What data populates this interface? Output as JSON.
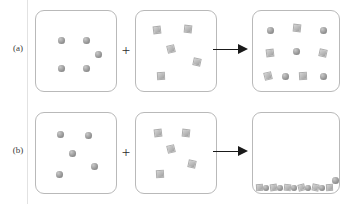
{
  "figure": {
    "operator_symbol": "+",
    "arrow_symbol": "→",
    "colors": {
      "sphere": "#9a9a9a",
      "cube": "#bdbdbd",
      "panel_border": "#b9b9b9",
      "arrow": "#1a1a1a",
      "label_text": "#3a3a3a"
    },
    "rows": [
      {
        "label": "(a)",
        "panels": [
          {
            "name": "spheres-input",
            "contents": "5 spheres",
            "objects": [
              {
                "shape": "sphere",
                "x": 22,
                "y": 26,
                "size": 7
              },
              {
                "shape": "sphere",
                "x": 47,
                "y": 26,
                "size": 7
              },
              {
                "shape": "sphere",
                "x": 59,
                "y": 40,
                "size": 7
              },
              {
                "shape": "sphere",
                "x": 22,
                "y": 54,
                "size": 7
              },
              {
                "shape": "sphere",
                "x": 47,
                "y": 54,
                "size": 7
              }
            ]
          },
          {
            "name": "cubes-input",
            "contents": "5 cubes",
            "objects": [
              {
                "shape": "cube",
                "x": 17,
                "y": 15,
                "size": 8,
                "rot": "r1"
              },
              {
                "shape": "cube",
                "x": 48,
                "y": 14,
                "size": 8,
                "rot": "r2"
              },
              {
                "shape": "cube",
                "x": 31,
                "y": 34,
                "size": 8,
                "rot": "r3"
              },
              {
                "shape": "cube",
                "x": 57,
                "y": 47,
                "size": 8,
                "rot": "r4"
              },
              {
                "shape": "cube",
                "x": 21,
                "y": 61,
                "size": 8,
                "rot": "r5"
              }
            ]
          },
          {
            "name": "mixed-output",
            "contents": "spheres and cubes mixed uniformly",
            "objects": [
              {
                "shape": "sphere",
                "x": 14,
                "y": 16,
                "size": 7
              },
              {
                "shape": "cube",
                "x": 40,
                "y": 13,
                "size": 8,
                "rot": "r2"
              },
              {
                "shape": "sphere",
                "x": 67,
                "y": 16,
                "size": 7
              },
              {
                "shape": "cube",
                "x": 13,
                "y": 38,
                "size": 8,
                "rot": "r1"
              },
              {
                "shape": "sphere",
                "x": 40,
                "y": 37,
                "size": 7
              },
              {
                "shape": "cube",
                "x": 66,
                "y": 38,
                "size": 8,
                "rot": "r4"
              },
              {
                "shape": "cube",
                "x": 11,
                "y": 61,
                "size": 8,
                "rot": "r3"
              },
              {
                "shape": "sphere",
                "x": 29,
                "y": 62,
                "size": 7
              },
              {
                "shape": "cube",
                "x": 46,
                "y": 61,
                "size": 8,
                "rot": "r5"
              },
              {
                "shape": "sphere",
                "x": 67,
                "y": 62,
                "size": 7
              }
            ]
          }
        ]
      },
      {
        "label": "(b)",
        "panels": [
          {
            "name": "spheres-input",
            "contents": "5 spheres",
            "objects": [
              {
                "shape": "sphere",
                "x": 21,
                "y": 18,
                "size": 7
              },
              {
                "shape": "sphere",
                "x": 49,
                "y": 19,
                "size": 7
              },
              {
                "shape": "sphere",
                "x": 33,
                "y": 37,
                "size": 7
              },
              {
                "shape": "sphere",
                "x": 55,
                "y": 50,
                "size": 7
              },
              {
                "shape": "sphere",
                "x": 20,
                "y": 58,
                "size": 7
              }
            ]
          },
          {
            "name": "cubes-input",
            "contents": "5 cubes",
            "objects": [
              {
                "shape": "cube",
                "x": 18,
                "y": 16,
                "size": 8,
                "rot": "r1"
              },
              {
                "shape": "cube",
                "x": 46,
                "y": 16,
                "size": 8,
                "rot": "r2"
              },
              {
                "shape": "cube",
                "x": 31,
                "y": 32,
                "size": 8,
                "rot": "r3"
              },
              {
                "shape": "cube",
                "x": 52,
                "y": 47,
                "size": 8,
                "rot": "r4"
              },
              {
                "shape": "cube",
                "x": 20,
                "y": 57,
                "size": 8,
                "rot": "r5"
              }
            ]
          },
          {
            "name": "settled-output",
            "contents": "all particles settled into a single bottom layer, empty above",
            "objects": [],
            "pile": [
              {
                "shape": "cube",
                "x": 2,
                "y": 4,
                "size": 7,
                "rot": "r5"
              },
              {
                "shape": "sphere",
                "x": 9,
                "y": 5,
                "size": 6
              },
              {
                "shape": "cube",
                "x": 16,
                "y": 4,
                "size": 7,
                "rot": "r1"
              },
              {
                "shape": "sphere",
                "x": 23,
                "y": 5,
                "size": 6
              },
              {
                "shape": "cube",
                "x": 30,
                "y": 4,
                "size": 7,
                "rot": "r2"
              },
              {
                "shape": "sphere",
                "x": 37,
                "y": 5,
                "size": 6
              },
              {
                "shape": "cube",
                "x": 44,
                "y": 4,
                "size": 7,
                "rot": "r3"
              },
              {
                "shape": "sphere",
                "x": 51,
                "y": 5,
                "size": 6
              },
              {
                "shape": "cube",
                "x": 58,
                "y": 4,
                "size": 7,
                "rot": "r4"
              },
              {
                "shape": "sphere",
                "x": 65,
                "y": 5,
                "size": 6
              },
              {
                "shape": "cube",
                "x": 72,
                "y": 4,
                "size": 7,
                "rot": "r5"
              },
              {
                "shape": "sphere",
                "x": 78,
                "y": -3,
                "size": 7
              }
            ]
          }
        ]
      }
    ]
  }
}
